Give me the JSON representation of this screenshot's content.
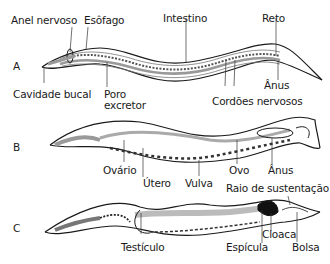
{
  "figure": {
    "panels": [
      {
        "letter": "A",
        "labels": {
          "anel_nervoso": "Anel nervoso",
          "esofago": "Esôfago",
          "intestino": "Intestino",
          "reto": "Reto",
          "anus": "Ânus",
          "cavidade_bucal": "Cavidade bucal",
          "poro_excretor_1": "Poro",
          "poro_excretor_2": "excretor",
          "cordoes_nervosos": "Cordões nervosos"
        }
      },
      {
        "letter": "B",
        "labels": {
          "ovario": "Ovário",
          "utero": "Útero",
          "vulva": "Vulva",
          "ovo": "Ovo",
          "anus": "Ânus"
        }
      },
      {
        "letter": "C",
        "labels": {
          "testiculo": "Testículo",
          "espicula": "Espícula",
          "cloaca": "Cloaca",
          "raio_sustentacao": "Raio de sustentação",
          "bolsa": "Bolsa"
        }
      }
    ],
    "colors": {
      "outline": "#1a1a1a",
      "gut": "#bdbdbd",
      "dark_organ": "#111111"
    }
  }
}
